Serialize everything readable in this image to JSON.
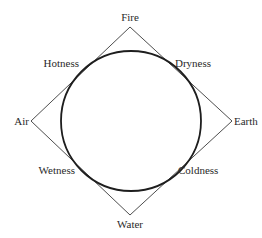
{
  "diagram": {
    "elements": {
      "top": "Fire",
      "left": "Air",
      "right": "Earth",
      "bottom": "Water"
    },
    "qualities": {
      "upper_left": "Hotness",
      "upper_right": "Dryness",
      "lower_left": "Wetness",
      "lower_right": "Coldness"
    },
    "colors": {
      "line": "#3a3a3a",
      "circle": "#1e1e1e",
      "text": "#2a2a2a",
      "background": "#ffffff"
    }
  }
}
